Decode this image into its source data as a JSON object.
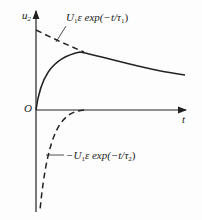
{
  "diagram": {
    "axes": {
      "y_label": "u",
      "y_label_sub": "2",
      "x_label": "t",
      "origin_label": "O"
    },
    "curves": [
      {
        "name": "upper-exponential",
        "style": "dashed",
        "label_prefix": "U",
        "label_sub": "1",
        "label_mid": "ε exp(−t/τ",
        "label_tau_sub": "1",
        "label_end": ")"
      },
      {
        "name": "resultant",
        "style": "solid"
      },
      {
        "name": "lower-exponential",
        "style": "dashed",
        "label_prefix": "−U",
        "label_sub": "1",
        "label_mid": "ε exp(−t/τ",
        "label_tau_sub": "2",
        "label_end": ")"
      }
    ],
    "colors": {
      "line": "#222222",
      "background": "#fdfdfd"
    }
  }
}
